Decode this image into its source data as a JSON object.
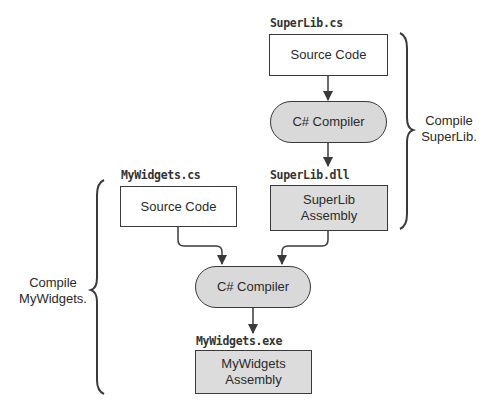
{
  "superlib": {
    "file_label": "SuperLib.cs",
    "source_box": "Source Code",
    "compiler": "C# Compiler",
    "output_label": "SuperLib.dll",
    "assembly_line1": "SuperLib",
    "assembly_line2": "Assembly",
    "brace_line1": "Compile",
    "brace_line2": "SuperLib."
  },
  "mywidgets": {
    "file_label": "MyWidgets.cs",
    "source_box": "Source Code",
    "compiler": "C# Compiler",
    "output_label": "MyWidgets.exe",
    "assembly_line1": "MyWidgets",
    "assembly_line2": "Assembly",
    "brace_line1": "Compile",
    "brace_line2": "MyWidgets."
  },
  "colors": {
    "stroke": "#3a3a3a",
    "compiler_fill": "#d9d9d9",
    "assembly_fill": "#dcdcdc",
    "source_fill": "#ffffff"
  }
}
